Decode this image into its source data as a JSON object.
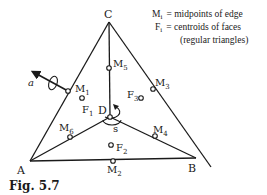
{
  "legend": {
    "line1_sym": "M",
    "line1_sub": "i",
    "line1_text": "= midpoints of edge",
    "line2_sym": "F",
    "line2_sub": "i",
    "line2_text": "= centroids of faces",
    "line3_text": "(regular triangles)"
  },
  "vertices": {
    "A": "A",
    "B": "B",
    "C": "C",
    "D": "D"
  },
  "midpoints": {
    "m1": {
      "sym": "M",
      "sub": "1"
    },
    "m2": {
      "sym": "M",
      "sub": "2"
    },
    "m3": {
      "sym": "M",
      "sub": "3"
    },
    "m4": {
      "sym": "M",
      "sub": "4"
    },
    "m5": {
      "sym": "M",
      "sub": "5"
    },
    "m6": {
      "sym": "M",
      "sub": "6"
    }
  },
  "centroids": {
    "f1": {
      "sym": "F",
      "sub": "1"
    },
    "f2": {
      "sym": "F",
      "sub": "2"
    },
    "f3": {
      "sym": "F",
      "sub": "3"
    }
  },
  "axes": {
    "a_label": "a",
    "s_label": "s"
  },
  "caption": "Fig. 5.7",
  "colors": {
    "ink": "#1a1a1a",
    "background": "#ffffff"
  }
}
